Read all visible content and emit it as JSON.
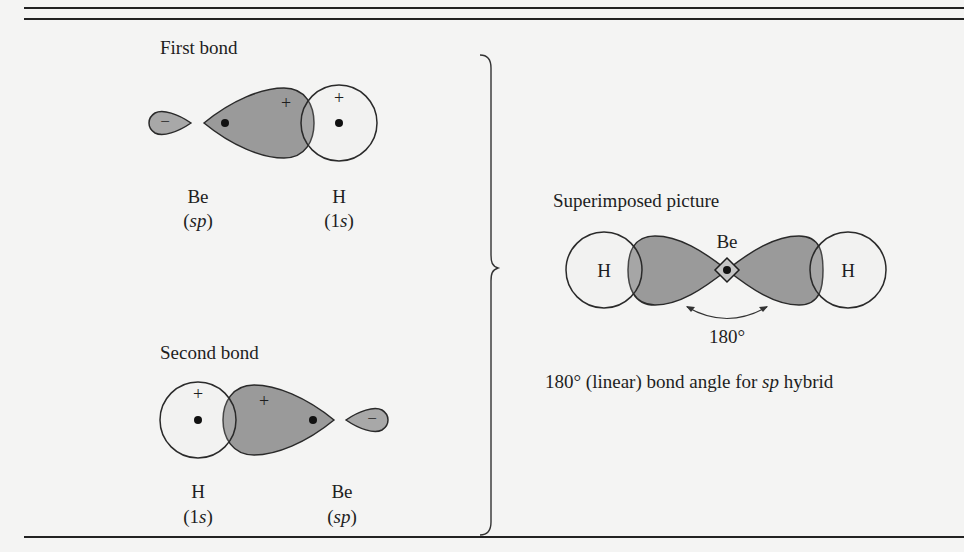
{
  "first_bond": {
    "title": "First bond",
    "left_label": "Be",
    "left_sub_open": "(",
    "left_sub_it": "sp",
    "left_sub_close": ")",
    "right_label": "H",
    "right_sub_open": "(1",
    "right_sub_it": "s",
    "right_sub_close": ")",
    "minus_sign": "−",
    "plus_lobe": "+",
    "plus_h": "+"
  },
  "second_bond": {
    "title": "Second bond",
    "left_label": "H",
    "left_sub_open": "(1",
    "left_sub_it": "s",
    "left_sub_close": ")",
    "right_label": "Be",
    "right_sub_open": "(",
    "right_sub_it": "sp",
    "right_sub_close": ")",
    "minus_sign": "−",
    "plus_lobe": "+",
    "plus_h": "+"
  },
  "superimposed": {
    "title": "Superimposed picture",
    "be_label": "Be",
    "h_left": "H",
    "h_right": "H",
    "angle_label": "180°",
    "caption_pre": "180° (linear) bond angle for ",
    "caption_it": "sp",
    "caption_post": " hybrid"
  },
  "colors": {
    "lobe_fill": "#9a9a9a",
    "small_lobe_fill": "#a8a8a8",
    "h_fill": "#ececeb",
    "stroke": "#2a2a2a",
    "background": "#f4f4f3"
  }
}
